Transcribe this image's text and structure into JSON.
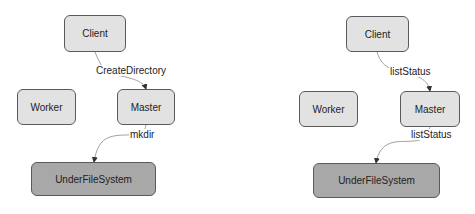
{
  "diagrams": [
    {
      "nodes": {
        "client": "Client",
        "worker": "Worker",
        "master": "Master",
        "ufs": "UnderFileSystem"
      },
      "edges": [
        {
          "from": "Client",
          "to": "Master",
          "label": "CreateDirectory"
        },
        {
          "from": "Master",
          "to": "UnderFileSystem",
          "label": "mkdir"
        }
      ]
    },
    {
      "nodes": {
        "client": "Client",
        "worker": "Worker",
        "master": "Master",
        "ufs": "UnderFileSystem"
      },
      "edges": [
        {
          "from": "Client",
          "to": "Master",
          "label": "listStatus"
        },
        {
          "from": "Master",
          "to": "UnderFileSystem",
          "label": "listStatus"
        }
      ]
    }
  ],
  "colors": {
    "node_fill": "#e2e2e2",
    "ufs_fill": "#a8a8a8",
    "border": "#5a5a5a",
    "edge": "#a0a0a0"
  }
}
